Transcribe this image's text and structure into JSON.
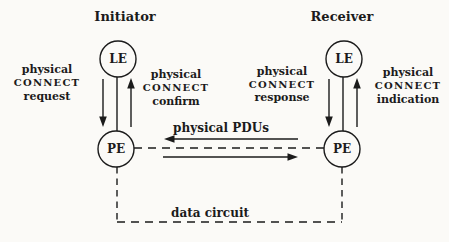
{
  "figure": {
    "colors": {
      "ink": "#1b1b1b",
      "background": "#fbfaf7"
    },
    "initiator": {
      "title": "Initiator",
      "le_label": "LE",
      "pe_label": "PE",
      "request_label": {
        "lines": [
          "physical",
          "CONNECT",
          "request"
        ]
      },
      "confirm_label": {
        "lines": [
          "physical",
          "CONNECT",
          "confirm"
        ]
      }
    },
    "receiver": {
      "title": "Receiver",
      "le_label": "LE",
      "pe_label": "PE",
      "response_label": {
        "lines": [
          "physical",
          "CONNECT",
          "response"
        ]
      },
      "indication_label": {
        "lines": [
          "physical",
          "CONNECT",
          "indication"
        ]
      }
    },
    "exchange": {
      "pdus_label": "physical PDUs",
      "data_circuit_label": "data circuit"
    }
  }
}
